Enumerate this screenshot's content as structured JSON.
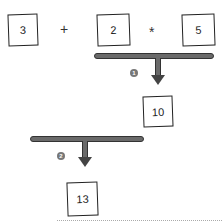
{
  "diagram": {
    "expression": {
      "operand_a": "3",
      "operator_plus": "+",
      "operand_b": "2",
      "operator_times": "*",
      "operand_c": "5"
    },
    "step1": {
      "badge": "1",
      "result": "10"
    },
    "step2": {
      "badge": "2",
      "result": "13"
    }
  }
}
